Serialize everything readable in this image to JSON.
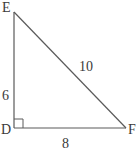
{
  "diagram": {
    "type": "right-triangle",
    "vertices": [
      {
        "label": "E",
        "x": 14,
        "y": 12
      },
      {
        "label": "D",
        "x": 14,
        "y": 128
      },
      {
        "label": "F",
        "x": 126,
        "y": 128
      }
    ],
    "right_angle_at": "D",
    "sides": [
      {
        "name": "ED",
        "label": "6"
      },
      {
        "name": "EF",
        "label": "10"
      },
      {
        "name": "DF",
        "label": "8"
      }
    ],
    "colors": {
      "line": "#5a5a5a",
      "text": "#3a3a3a",
      "background": "#ffffff"
    }
  }
}
